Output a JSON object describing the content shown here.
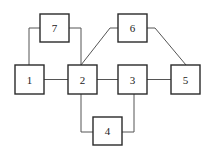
{
  "diagram": {
    "type": "block-graph",
    "nodes": [
      {
        "id": "1",
        "label": "1",
        "x": 15,
        "y": 65,
        "w": 29,
        "h": 29
      },
      {
        "id": "2",
        "label": "2",
        "x": 68,
        "y": 65,
        "w": 29,
        "h": 29
      },
      {
        "id": "3",
        "label": "3",
        "x": 118,
        "y": 65,
        "w": 29,
        "h": 29
      },
      {
        "id": "4",
        "label": "4",
        "x": 93,
        "y": 117,
        "w": 29,
        "h": 28
      },
      {
        "id": "5",
        "label": "5",
        "x": 171,
        "y": 65,
        "w": 29,
        "h": 29
      },
      {
        "id": "6",
        "label": "6",
        "x": 118,
        "y": 14,
        "w": 29,
        "h": 28
      },
      {
        "id": "7",
        "label": "7",
        "x": 40,
        "y": 14,
        "w": 29,
        "h": 28
      }
    ],
    "edges": [
      {
        "from": "1",
        "to": "7"
      },
      {
        "from": "7",
        "to": "2"
      },
      {
        "from": "1",
        "to": "2"
      },
      {
        "from": "2",
        "to": "6"
      },
      {
        "from": "6",
        "to": "5"
      },
      {
        "from": "2",
        "to": "3"
      },
      {
        "from": "3",
        "to": "5"
      },
      {
        "from": "2",
        "to": "4"
      },
      {
        "from": "4",
        "to": "3"
      }
    ],
    "colors": {
      "stroke": "#2a2a2a",
      "edge": "#555555",
      "background": "#ffffff"
    }
  }
}
